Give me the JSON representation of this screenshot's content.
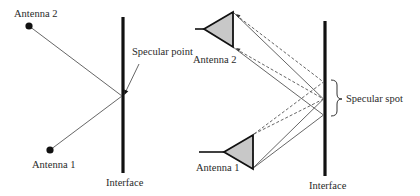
{
  "left_panel": {
    "antenna2_label": "Antenna 2",
    "antenna1_label": "Antenna 1",
    "specular_point_label": "Specular point",
    "interface_label": "Interface"
  },
  "right_panel": {
    "antenna2_label": "Antenna 2",
    "antenna1_label": "Antenna 1",
    "specular_spot_label": "Specular spot",
    "interface_label": "Interface"
  },
  "colors": {
    "line": "#1a1a1a",
    "ray": "#555555",
    "antenna_fill": "#c8c8c8"
  }
}
